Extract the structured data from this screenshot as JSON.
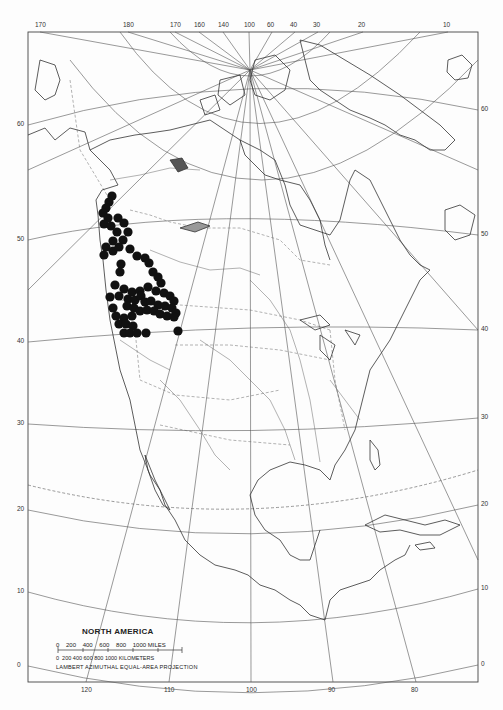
{
  "map": {
    "title": "NORTH AMERICA",
    "projection": "LAMBERT AZIMUTHAL EQUAL-AREA PROJECTION",
    "scale": {
      "miles_ticks": [
        "0",
        "200",
        "400",
        "600",
        "800",
        "1000 MILES"
      ],
      "km_ticks": [
        "0",
        "200",
        "400",
        "600",
        "800",
        "1000 KILOMETERS"
      ],
      "miles_label": "0    200    400    600    800    1000 MILES",
      "km_label": "0  200 400 600 800 1000 KILOMETERS"
    },
    "top_longitude_labels": [
      {
        "text": "170",
        "x": 40
      },
      {
        "text": "180",
        "x": 128
      },
      {
        "text": "170",
        "x": 175
      },
      {
        "text": "160",
        "x": 199
      },
      {
        "text": "140",
        "x": 223
      },
      {
        "text": "100",
        "x": 249
      },
      {
        "text": "60",
        "x": 272
      },
      {
        "text": "40",
        "x": 295
      },
      {
        "text": "30",
        "x": 318
      },
      {
        "text": "20",
        "x": 363
      },
      {
        "text": "10",
        "x": 448
      }
    ],
    "bottom_longitude_labels": [
      {
        "text": "120",
        "x": 86
      },
      {
        "text": "110",
        "x": 169
      },
      {
        "text": "100",
        "x": 251
      },
      {
        "text": "90",
        "x": 333
      },
      {
        "text": "80",
        "x": 416
      }
    ],
    "left_latitude_labels": [
      {
        "text": "60",
        "y": 125
      },
      {
        "text": "50",
        "y": 240
      },
      {
        "text": "40",
        "y": 342
      },
      {
        "text": "30",
        "y": 424
      },
      {
        "text": "20",
        "y": 510
      },
      {
        "text": "10",
        "y": 592
      },
      {
        "text": "0",
        "y": 666
      }
    ],
    "right_latitude_labels": [
      {
        "text": "60",
        "y": 110
      },
      {
        "text": "50",
        "y": 235
      },
      {
        "text": "40",
        "y": 330
      },
      {
        "text": "30",
        "y": 418
      },
      {
        "text": "20",
        "y": 505
      },
      {
        "text": "10",
        "y": 589
      },
      {
        "text": "0",
        "y": 665
      }
    ],
    "colors": {
      "line": "#444444",
      "dot": "#111111",
      "background": "#fdfdfd"
    },
    "occurrence_dots": [
      [
        112,
        196
      ],
      [
        109,
        202
      ],
      [
        106,
        208
      ],
      [
        103,
        213
      ],
      [
        108,
        218
      ],
      [
        104,
        224
      ],
      [
        111,
        226
      ],
      [
        118,
        218
      ],
      [
        124,
        223
      ],
      [
        128,
        232
      ],
      [
        117,
        232
      ],
      [
        123,
        240
      ],
      [
        113,
        241
      ],
      [
        106,
        247
      ],
      [
        104,
        255
      ],
      [
        113,
        251
      ],
      [
        119,
        247
      ],
      [
        130,
        249
      ],
      [
        137,
        256
      ],
      [
        145,
        258
      ],
      [
        121,
        264
      ],
      [
        120,
        272
      ],
      [
        149,
        263
      ],
      [
        153,
        272
      ],
      [
        158,
        277
      ],
      [
        161,
        283
      ],
      [
        115,
        285
      ],
      [
        124,
        289
      ],
      [
        132,
        292
      ],
      [
        140,
        291
      ],
      [
        148,
        287
      ],
      [
        156,
        291
      ],
      [
        164,
        293
      ],
      [
        170,
        296
      ],
      [
        174,
        301
      ],
      [
        110,
        297
      ],
      [
        119,
        296
      ],
      [
        128,
        299
      ],
      [
        135,
        300
      ],
      [
        141,
        296
      ],
      [
        145,
        302
      ],
      [
        151,
        301
      ],
      [
        158,
        305
      ],
      [
        165,
        306
      ],
      [
        172,
        308
      ],
      [
        176,
        313
      ],
      [
        127,
        306
      ],
      [
        134,
        308
      ],
      [
        140,
        311
      ],
      [
        147,
        310
      ],
      [
        154,
        311
      ],
      [
        160,
        314
      ],
      [
        167,
        316
      ],
      [
        174,
        317
      ],
      [
        132,
        316
      ],
      [
        124,
        318
      ],
      [
        119,
        324
      ],
      [
        126,
        324
      ],
      [
        133,
        326
      ],
      [
        124,
        333
      ],
      [
        130,
        333
      ],
      [
        137,
        333
      ],
      [
        146,
        333
      ],
      [
        178,
        331
      ],
      [
        113,
        308
      ],
      [
        116,
        316
      ]
    ]
  }
}
